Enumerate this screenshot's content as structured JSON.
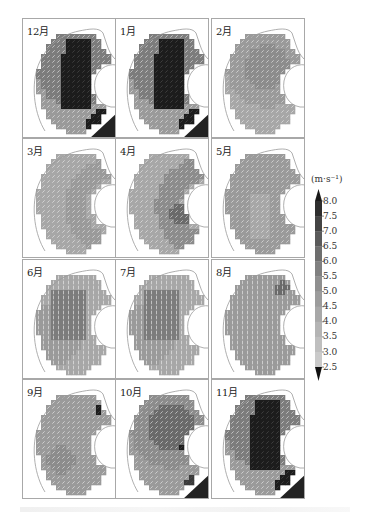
{
  "figure": {
    "panels": [
      {
        "label": "12月",
        "pattern": "strong_ne"
      },
      {
        "label": "1月",
        "pattern": "strong_ne"
      },
      {
        "label": "2月",
        "pattern": "moderate_ne"
      },
      {
        "label": "3月",
        "pattern": "ring_light"
      },
      {
        "label": "4月",
        "pattern": "ring_mid"
      },
      {
        "label": "5月",
        "pattern": "ring_light_sw"
      },
      {
        "label": "6月",
        "pattern": "summer_sw"
      },
      {
        "label": "7月",
        "pattern": "summer_sw"
      },
      {
        "label": "8月",
        "pattern": "weak"
      },
      {
        "label": "9月",
        "pattern": "weak_ne"
      },
      {
        "label": "10月",
        "pattern": "moderate_ne_dark"
      },
      {
        "label": "11月",
        "pattern": "strong_ne"
      }
    ],
    "layout": {
      "columns": 3,
      "rows": 4
    }
  },
  "colorbar": {
    "unit": "(m·s⁻¹)",
    "ticks": [
      "8.0",
      "7.5",
      "7.0",
      "6.5",
      "6.0",
      "5.5",
      "5.0",
      "4.5",
      "4.0",
      "3.5",
      "3.0",
      "2.5"
    ],
    "colors": [
      "#1a1a1a",
      "#2e2e2e",
      "#444444",
      "#5a5a5a",
      "#6e6e6e",
      "#808080",
      "#8f8f8f",
      "#9c9c9c",
      "#a8a8a8",
      "#b4b4b4",
      "#bfbfbf",
      "#cacaca",
      "#d4d4d4"
    ]
  },
  "chart_data": {
    "type": "heatmap",
    "title": "",
    "panels": [
      "12月",
      "1月",
      "2月",
      "3月",
      "4月",
      "5月",
      "6月",
      "7月",
      "8月",
      "9月",
      "10月",
      "11月"
    ],
    "colorbar_label": "(m·s⁻¹)",
    "colorbar_ticks": [
      8.0,
      7.5,
      7.0,
      6.5,
      6.0,
      5.5,
      5.0,
      4.5,
      4.0,
      3.5,
      3.0,
      2.5
    ],
    "colorbar_range": [
      2.5,
      8.0
    ],
    "approx_max_speed_by_month": {
      "12月": 8.0,
      "1月": 8.0,
      "2月": 6.5,
      "3月": 6.0,
      "4月": 6.5,
      "5月": 5.5,
      "6月": 6.5,
      "7月": 6.5,
      "8月": 5.5,
      "9月": 6.0,
      "10月": 7.5,
      "11月": 8.0
    }
  }
}
